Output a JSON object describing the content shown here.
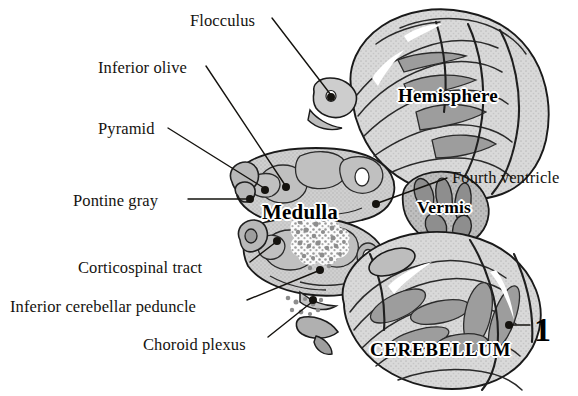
{
  "figure": {
    "background_color": "#ffffff",
    "width": 578,
    "height": 396,
    "index_number": "1"
  },
  "callouts": [
    {
      "id": "flocculus",
      "label": "Flocculus",
      "text_x": 190,
      "text_y": 13,
      "align": "left",
      "line": [
        [
          272,
          18
        ],
        [
          331,
          95
        ]
      ],
      "dot": [
        331,
        97
      ]
    },
    {
      "id": "inferior-olive",
      "label": "Inferior olive",
      "text_x": 98,
      "text_y": 60,
      "align": "left",
      "line": [
        [
          206,
          66
        ],
        [
          285,
          185
        ]
      ],
      "dot": [
        286,
        187
      ]
    },
    {
      "id": "pyramid",
      "label": "Pyramid",
      "text_x": 98,
      "text_y": 121,
      "align": "left",
      "line": [
        [
          168,
          128
        ],
        [
          264,
          188
        ]
      ],
      "dot": [
        265,
        190
      ]
    },
    {
      "id": "pontine-gray",
      "label": "Pontine gray",
      "text_x": 73,
      "text_y": 193,
      "align": "left",
      "line": [
        [
          188,
          199
        ],
        [
          248,
          199
        ]
      ],
      "dot": [
        250,
        199
      ]
    },
    {
      "id": "corticospinal-tract",
      "label": "Corticospinal tract",
      "text_x": 78,
      "text_y": 260,
      "align": "left",
      "line": [
        [
          250,
          262
        ],
        [
          276,
          242
        ]
      ],
      "dot": [
        277,
        241
      ]
    },
    {
      "id": "inferior-cerebellar-peduncle",
      "label": "Inferior cerebellar peduncle",
      "text_x": 10,
      "text_y": 299,
      "align": "left",
      "line": [
        [
          247,
          300
        ],
        [
          318,
          271
        ]
      ],
      "dot": [
        320,
        270
      ]
    },
    {
      "id": "choroid-plexus",
      "label": "Choroid plexus",
      "text_x": 143,
      "text_y": 337,
      "align": "left",
      "line": [
        [
          268,
          337
        ],
        [
          312,
          302
        ]
      ],
      "dot": [
        313,
        300
      ]
    },
    {
      "id": "fourth-ventricle",
      "label": "Fourth ventricle",
      "text_x": 452,
      "text_y": 170,
      "align": "left",
      "line": [
        [
          447,
          178
        ],
        [
          378,
          203
        ]
      ],
      "dot": [
        376,
        204
      ]
    },
    {
      "id": "index-marker",
      "label": "1",
      "text_x": 534,
      "text_y": 313,
      "align": "left",
      "line": [
        [
          530,
          325
        ],
        [
          511,
          325
        ]
      ],
      "dot": [
        509,
        325
      ]
    }
  ],
  "structure_labels": [
    {
      "id": "medulla",
      "label": "Medulla",
      "x": 262,
      "y": 202,
      "style": "medulla"
    },
    {
      "id": "hemisphere",
      "label": "Hemisphere",
      "x": 398,
      "y": 86,
      "style": "hemisphere"
    },
    {
      "id": "vermis",
      "label": "Vermis",
      "x": 417,
      "y": 199,
      "style": "vermis"
    },
    {
      "id": "cerebellum",
      "label": "CEREBELLUM",
      "x": 370,
      "y": 340,
      "style": "cerebellum"
    }
  ],
  "colors": {
    "outline": "#1a1a1a",
    "tissue_light": "#d6d6d6",
    "tissue_mid": "#b4b4b4",
    "tissue_dark": "#8f8f8f",
    "tissue_darker": "#6e6e6e",
    "leader_line": "#15130f",
    "text": "#15130f",
    "background": "#ffffff"
  }
}
